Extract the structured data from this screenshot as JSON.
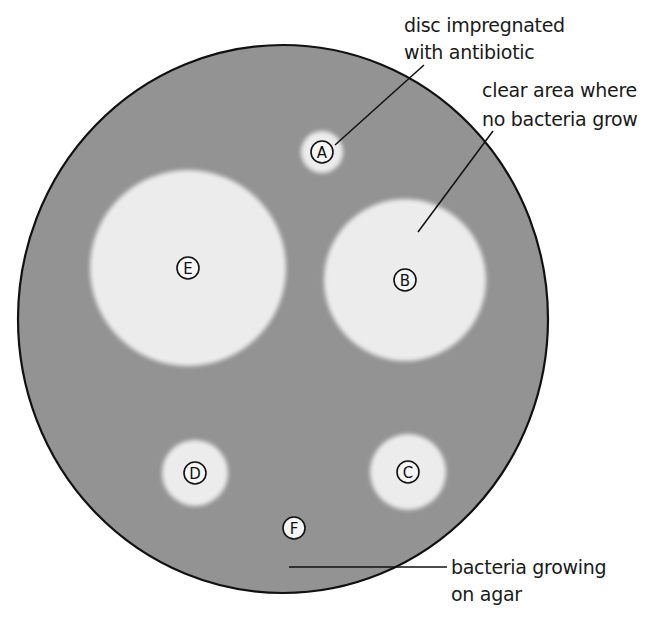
{
  "colors": {
    "background": "#ffffff",
    "agar_bacteria": "#939393",
    "clear_zone": "#ececec",
    "outline": "#111111",
    "text": "#1a1a1a"
  },
  "dish": {
    "cx": 283,
    "cy": 319,
    "rx": 265,
    "ry": 274
  },
  "discs": [
    {
      "label": "A",
      "cx": 322,
      "cy": 152,
      "zone_radius": 21
    },
    {
      "label": "B",
      "cx": 405,
      "cy": 280,
      "zone_radius": 81
    },
    {
      "label": "C",
      "cx": 408,
      "cy": 472,
      "zone_radius": 38
    },
    {
      "label": "D",
      "cx": 195,
      "cy": 473,
      "zone_radius": 33
    },
    {
      "label": "E",
      "cx": 188,
      "cy": 268,
      "zone_radius": 98
    },
    {
      "label": "F",
      "cx": 294,
      "cy": 528,
      "zone_radius": 0
    }
  ],
  "annotations": {
    "disc": {
      "line1": "disc impregnated",
      "line2": "with antibiotic"
    },
    "clear_area": {
      "line1": "clear area where",
      "line2": "no bacteria grow"
    },
    "bacteria": {
      "line1": "bacteria growing",
      "line2": "on agar"
    }
  }
}
